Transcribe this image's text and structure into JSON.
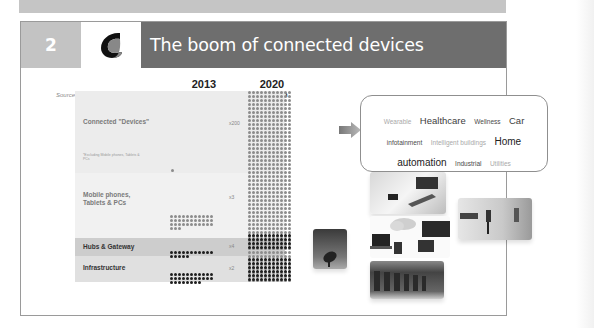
{
  "slide": {
    "number": "2",
    "title": "The boom of connected devices",
    "source": "Source: PiperJaffray / Cisco"
  },
  "columns": [
    {
      "year": "2013",
      "total": "10 Billion"
    },
    {
      "year": "2020",
      "total": "50 Billion"
    }
  ],
  "rows": [
    {
      "label": "Connected \"Devices\"",
      "note": "*Excluding Mobile phones, Tablets & PCs",
      "multiplier": "x200"
    },
    {
      "label": "Mobile phones, Tablets & PCs",
      "multiplier": "x3"
    },
    {
      "label": "Hubs & Gateway",
      "multiplier": "x4"
    },
    {
      "label": "Infrastructure",
      "multiplier": "x2"
    }
  ],
  "tags": [
    {
      "text": "Wearable",
      "style": "light"
    },
    {
      "text": "Healthcare",
      "style": "lg"
    },
    {
      "text": "Wellness",
      "style": "md"
    },
    {
      "text": "Car",
      "style": "lg"
    },
    {
      "text": "infotainment",
      "style": "md"
    },
    {
      "text": "Intelligent buildings",
      "style": "light"
    },
    {
      "text": "Home",
      "style": "xlg"
    },
    {
      "text": "automation",
      "style": "xlg"
    },
    {
      "text": "Industrial",
      "style": "md"
    },
    {
      "text": "Utilities",
      "style": "light"
    }
  ],
  "colors": {
    "title_bar": "#6e6e6e",
    "number_box": "#c3c3c3",
    "dot_light": "#8c8c8c",
    "dot_dark": "#1e1e1e"
  },
  "images": [
    {
      "name": "satellite-dish-image"
    },
    {
      "name": "tablet-hands-image"
    },
    {
      "name": "devices-cloud-image"
    },
    {
      "name": "data-center-image"
    },
    {
      "name": "smart-building-image"
    }
  ]
}
